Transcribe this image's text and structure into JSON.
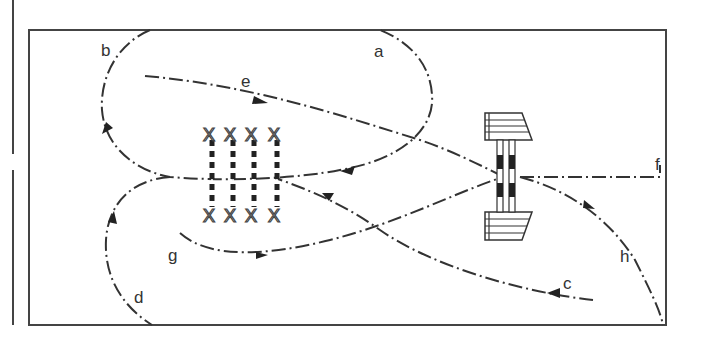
{
  "diagram": {
    "type": "riding-arena-course",
    "labels": {
      "a": "a",
      "b": "b",
      "c": "c",
      "d": "d",
      "e": "e",
      "f": "f",
      "g": "g",
      "h": "h"
    },
    "elements": {
      "poles": {
        "count": 4,
        "description": "four ground poles with X standards at each end"
      },
      "jump": {
        "description": "fence/jump with two wing stands and striped poles"
      }
    },
    "colors": {
      "line": "#333333",
      "background": "#ffffff"
    }
  }
}
